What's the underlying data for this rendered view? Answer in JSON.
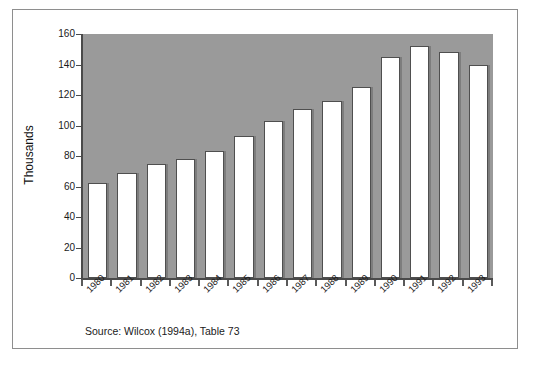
{
  "chart_data": {
    "type": "bar",
    "title": "",
    "subtitle": "",
    "xlabel": "",
    "ylabel": "Thousands",
    "categories": [
      "1980",
      "1981",
      "1982",
      "1983",
      "1984",
      "1985",
      "1986",
      "1987",
      "1988",
      "1989",
      "1990",
      "1991",
      "1992",
      "1993"
    ],
    "values": [
      62,
      69,
      75,
      78,
      83,
      93,
      103,
      111,
      116,
      125,
      145,
      152,
      148,
      140
    ],
    "series": [
      {
        "name": "Thousands",
        "values": [
          62,
          69,
          75,
          78,
          83,
          93,
          103,
          111,
          116,
          125,
          145,
          152,
          148,
          140
        ]
      }
    ],
    "ylim": [
      0,
      160
    ],
    "yticks": [
      0,
      20,
      40,
      60,
      80,
      100,
      120,
      140,
      160
    ],
    "ytick_labels": [
      "0",
      "20",
      "40",
      "60",
      "80",
      "100",
      "120",
      "140",
      "160"
    ],
    "grid": false,
    "legend": null,
    "annotations": [
      "Source: Wilcox (1994a), Table 73"
    ],
    "colors": {
      "plot_background": "#9a9a9a",
      "bar_fill": "#ffffff",
      "bar_edge": "#4f4f4f",
      "axis": "#4a4a4a",
      "frame": "#8e8e8e",
      "text": "#1a1a1a",
      "figure_background": "#ffffff"
    }
  },
  "figure": {
    "source_note": "Source: Wilcox (1994a), Table 73"
  }
}
